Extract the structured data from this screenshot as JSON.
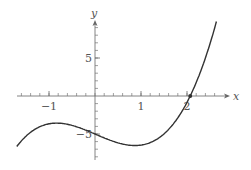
{
  "chart_data": {
    "type": "line",
    "title": "",
    "xlabel": "x",
    "ylabel": "y",
    "xlim": [
      -1.7,
      2.65
    ],
    "ylim": [
      -8.5,
      11
    ],
    "x_ticks": [
      -1,
      1,
      2
    ],
    "x_tick_labels": [
      "−1",
      "1",
      "2"
    ],
    "y_ticks": [
      5,
      -5
    ],
    "y_tick_labels": [
      "5",
      "−5"
    ],
    "minor_x_step": 0.2,
    "minor_y_step": 1,
    "grid": false,
    "legend": null,
    "series": [
      {
        "name": "f(x)",
        "description": "cubic curve",
        "coefficients": {
          "a": 1.2,
          "b": -0.06,
          "c": -2.6,
          "d": -5
        },
        "x": [
          -1.7,
          -1.5,
          -1.25,
          -1.0,
          -0.83,
          -0.5,
          -0.25,
          0,
          0.25,
          0.5,
          0.87,
          1.0,
          1.25,
          1.5,
          1.75,
          2.0,
          2.07,
          2.25,
          2.5,
          2.65
        ],
        "y": [
          -6.6,
          -5.2,
          -4.2,
          -3.7,
          -3.6,
          -3.9,
          -4.4,
          -5.0,
          -5.6,
          -6.1,
          -6.4,
          -6.4,
          -5.9,
          -4.9,
          -3.3,
          -0.9,
          0.0,
          2.1,
          5.3,
          8.9
        ]
      }
    ],
    "annotations": [
      {
        "type": "point",
        "x": 2.07,
        "y": 0,
        "label": "root"
      }
    ],
    "color": "#333333"
  }
}
